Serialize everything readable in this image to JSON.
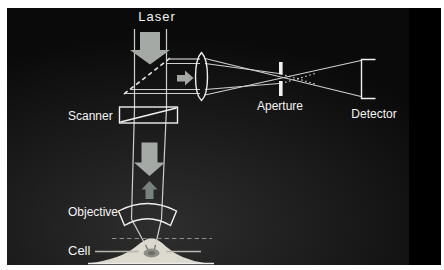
{
  "theme": {
    "page": "#ffffff",
    "slide_dark": "#0a0a0a",
    "slide_light": "#2e2e2e",
    "line": "#cfcfcf",
    "bright": "#f0f0f0",
    "dim": "#9c9c96",
    "arrow": "#a4a9a6",
    "arrow_dark": "#78817d",
    "text": "#f4f4f4",
    "cell_fill": "#dcd9cf",
    "focal_spot": "#8f8f88"
  },
  "labels": {
    "laser": "Laser",
    "scanner": "Scanner",
    "aperture": "Aperture",
    "detector": "Detector",
    "objective": "Objective",
    "cell": "Cell"
  }
}
